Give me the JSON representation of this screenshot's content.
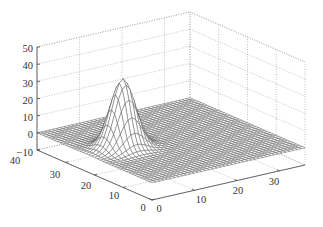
{
  "chart_data": {
    "type": "surface3d",
    "title": "",
    "xlabel": "",
    "ylabel": "",
    "zlabel": "",
    "x_ticks": [
      0,
      10,
      20,
      30
    ],
    "y_ticks": [
      0,
      10,
      20,
      30,
      40
    ],
    "z_ticks": [
      -10,
      0,
      10,
      20,
      30,
      40,
      50
    ],
    "xlim": [
      0,
      36
    ],
    "ylim": [
      0,
      40
    ],
    "zlim": [
      -10,
      50
    ],
    "grid": true,
    "legend": null,
    "surface": {
      "description": "Mesh surface, flat near z=0 with a single sharp Gaussian-like peak",
      "peak": {
        "x": 8,
        "y": 22,
        "z": 40
      },
      "peak_width_sigma": 2.5,
      "baseline_z": 0,
      "grid_resolution": 40
    },
    "colors": {
      "mesh_line": "#555555",
      "mesh_face": "#ffffff",
      "grid": "#9a9a9a",
      "axis": "#444444"
    }
  },
  "labels": {
    "z_ticks": [
      "50",
      "40",
      "30",
      "20",
      "10",
      "0",
      "−10"
    ],
    "y_ticks": [
      "40",
      "30",
      "20",
      "10",
      "0"
    ],
    "x_ticks": [
      "0",
      "10",
      "20",
      "30"
    ]
  }
}
